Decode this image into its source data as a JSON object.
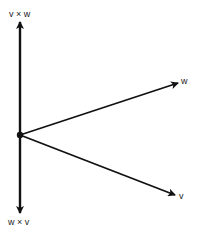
{
  "diagram": {
    "colors": {
      "stroke": "#111111",
      "label": "#222222",
      "background": "#ffffff"
    },
    "origin": {
      "x": 20,
      "y": 135
    },
    "vectors": [
      {
        "id": "v_cross_w",
        "label": "v × w",
        "tip": {
          "x": 20,
          "y": 22
        }
      },
      {
        "id": "w_cross_v",
        "label": "w × v",
        "tip": {
          "x": 20,
          "y": 212
        }
      },
      {
        "id": "w",
        "label": "w",
        "tip": {
          "x": 178,
          "y": 83
        }
      },
      {
        "id": "v",
        "label": "v",
        "tip": {
          "x": 175,
          "y": 195
        }
      }
    ]
  }
}
